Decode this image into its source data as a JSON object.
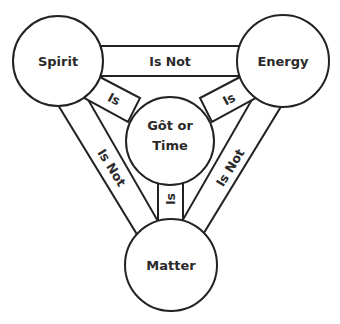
{
  "colors": {
    "stroke": "#222222",
    "fill": "#ffffff",
    "text": "#2a2a2a"
  },
  "nodes": {
    "spirit": {
      "label": "Spirit"
    },
    "energy": {
      "label": "Energy"
    },
    "matter": {
      "label": "Matter"
    },
    "center": {
      "line1": "Gôt or",
      "line2": "Time"
    }
  },
  "edges": {
    "spirit_energy": {
      "label": "Is Not"
    },
    "spirit_matter": {
      "label": "Is Not"
    },
    "energy_matter": {
      "label": "Is Not"
    },
    "spirit_center": {
      "label": "Is"
    },
    "energy_center": {
      "label": "Is"
    },
    "matter_center": {
      "label": "Is"
    }
  }
}
